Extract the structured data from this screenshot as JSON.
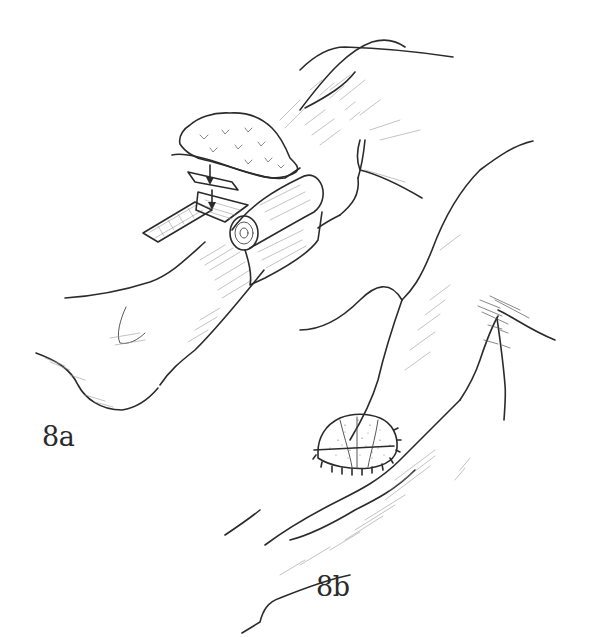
{
  "figure": {
    "panels": [
      {
        "id": "8a",
        "label": "8a",
        "subject": "lower leg with layered dressing, gauze pad, mesh strip and rolled bandage",
        "elements": [
          "leg",
          "foot",
          "gauze-pad",
          "non-adherent-layer",
          "mesh-strip",
          "rolled-bandage",
          "down-arrows"
        ]
      },
      {
        "id": "8b",
        "label": "8b",
        "subject": "arm with sutured tie-over bolster dressing",
        "elements": [
          "upper-arm",
          "forearm",
          "elbow-crease",
          "bolster-dressing",
          "sutures"
        ]
      }
    ]
  },
  "colors": {
    "background": "#ffffff",
    "ink": "#2b2b2b",
    "hatch": "#9a9a9a"
  }
}
